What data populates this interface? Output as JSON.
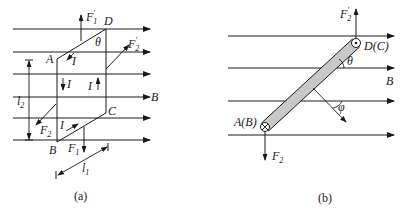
{
  "figure_a": {
    "caption": "(a)",
    "field_label": "B",
    "vertices": {
      "A": "A",
      "B": "B",
      "C": "C",
      "D": "D"
    },
    "angle_label": "θ",
    "current_label": "I",
    "forces": {
      "F1_prime": {
        "main": "F",
        "sub": "1",
        "prime": "′"
      },
      "F2_prime": {
        "main": "F",
        "sub": "2",
        "prime": "′"
      },
      "F1": {
        "main": "F",
        "sub": "1"
      },
      "F2": {
        "main": "F",
        "sub": "2"
      }
    },
    "dimensions": {
      "l1": {
        "main": "l",
        "sub": "1"
      },
      "l2": {
        "main": "l",
        "sub": "2"
      }
    }
  },
  "figure_b": {
    "caption": "(b)",
    "field_label": "B",
    "top_end_label": "D(C)",
    "bottom_end_label": "A(B)",
    "angle_theta": "θ",
    "angle_phi": "φ",
    "forces": {
      "F2_prime": {
        "main": "F",
        "sub": "2",
        "prime": "′"
      },
      "F2": {
        "main": "F",
        "sub": "2"
      }
    },
    "colors": {
      "rod_fill": "#c8c8c8",
      "ink": "#1a1a1a"
    }
  }
}
